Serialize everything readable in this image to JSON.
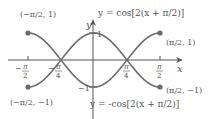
{
  "chart_data": {
    "type": "line",
    "title": "",
    "xlabel": "x",
    "ylabel": "y",
    "xlim": [
      -1.5708,
      1.5708
    ],
    "ylim": [
      -1,
      1
    ],
    "x_ticks": [
      "-π/2",
      "-π/4",
      "π/4",
      "π/2"
    ],
    "y_ticks": [
      "1",
      "-1"
    ],
    "series": [
      {
        "name": "y = cos[2(x + π/2)]",
        "function": "cos(2(x+pi/2))",
        "endpoints": [
          [
            -1.5708,
            1
          ],
          [
            1.5708,
            1
          ]
        ]
      },
      {
        "name": "y = -cos[2(x + π/2)]",
        "function": "-cos(2(x+pi/2))",
        "endpoints": [
          [
            -1.5708,
            -1
          ],
          [
            1.5708,
            -1
          ]
        ]
      }
    ],
    "annotations": [
      "(-π/2, 1)",
      "(π/2, 1)",
      "(-π/2, -1)",
      "(π/2, -1)"
    ]
  },
  "labels": {
    "top_eq_prefix": "y = cos[2(",
    "top_eq_x": "x",
    "top_eq_mid": " + ",
    "eq_suffix": ")]",
    "bottom_eq_prefix": "y = −cos[2(",
    "axis_x": "x",
    "axis_y": "y",
    "tick_one": "1",
    "tick_neg_one": "−1",
    "pi": "π",
    "two": "2",
    "four": "4",
    "minus": "−",
    "pt_tl": "(−π/2, 1)",
    "pt_tr": "(π/2, 1)",
    "pt_bl": "(−π/2, −1)",
    "pt_br": "(π/2, −1)"
  },
  "colors": {
    "curve": "#6b6b6b",
    "axis": "#555555",
    "text": "#555555"
  }
}
